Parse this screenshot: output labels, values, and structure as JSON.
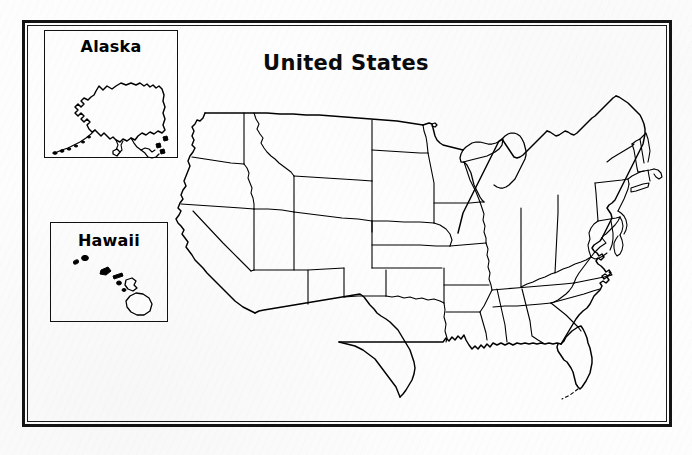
{
  "document": {
    "title": "United States",
    "type": "blank-outline-map-worksheet",
    "background_color": "#fdfdfd",
    "ink_color": "#000000"
  },
  "frame": {
    "style": "double-rule-border",
    "outer_color": "#141414",
    "inner_color": "#1a1a1a"
  },
  "insets": [
    {
      "key": "alaska",
      "label": "Alaska",
      "box": {
        "x": 44,
        "y": 30,
        "width": 134,
        "height": 128
      }
    },
    {
      "key": "hawaii",
      "label": "Hawaii",
      "box": {
        "x": 50,
        "y": 222,
        "width": 118,
        "height": 100
      }
    }
  ],
  "map": {
    "region_name": "United States",
    "projection_note": "contiguous 48 states with state borders, no labels",
    "states_shown": [
      "Washington",
      "Oregon",
      "California",
      "Nevada",
      "Idaho",
      "Montana",
      "Wyoming",
      "Utah",
      "Arizona",
      "Colorado",
      "New Mexico",
      "North Dakota",
      "South Dakota",
      "Nebraska",
      "Kansas",
      "Oklahoma",
      "Texas",
      "Minnesota",
      "Iowa",
      "Missouri",
      "Arkansas",
      "Louisiana",
      "Wisconsin",
      "Illinois",
      "Michigan",
      "Indiana",
      "Ohio",
      "Kentucky",
      "Tennessee",
      "Mississippi",
      "Alabama",
      "Georgia",
      "Florida",
      "South Carolina",
      "North Carolina",
      "Virginia",
      "West Virginia",
      "Maryland",
      "Delaware",
      "Pennsylvania",
      "New Jersey",
      "New York",
      "Connecticut",
      "Rhode Island",
      "Massachusetts",
      "Vermont",
      "New Hampshire",
      "Maine"
    ],
    "insets_shown": [
      "Alaska",
      "Hawaii"
    ]
  }
}
